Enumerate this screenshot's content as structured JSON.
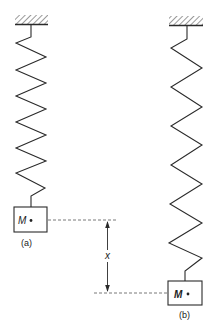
{
  "figure": {
    "panel_a": {
      "mass_label": "M",
      "caption": "(a)"
    },
    "panel_b": {
      "mass_label": "M",
      "caption": "(b)"
    },
    "displacement_label": "x"
  },
  "colors": {
    "line": "#2a2a2a",
    "dashed": "#555555",
    "background": "#ffffff"
  }
}
